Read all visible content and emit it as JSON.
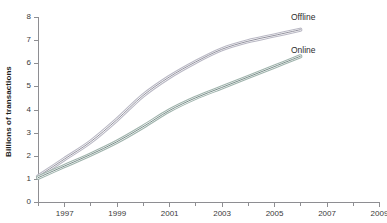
{
  "chart_data": {
    "type": "line",
    "title": "",
    "subtitle": "",
    "xlabel": "",
    "ylabel": "Billions of transactions",
    "xlim": [
      1996,
      2009
    ],
    "ylim": [
      0,
      8
    ],
    "grid": false,
    "legend_position": "right-inline-labels",
    "x_tick_labels": [
      "1997",
      "1999",
      "2001",
      "2003",
      "2005",
      "2007",
      "2009"
    ],
    "x_tick_values": [
      1997,
      1999,
      2001,
      2003,
      2005,
      2007,
      2009
    ],
    "x_minor_tick_values": [
      1996,
      1998,
      2000,
      2002,
      2004,
      2006,
      2008
    ],
    "y_tick_labels": [
      "0",
      "1",
      "2",
      "3",
      "4",
      "5",
      "6",
      "7",
      "8"
    ],
    "y_tick_values": [
      0,
      1,
      2,
      3,
      4,
      5,
      6,
      7,
      8
    ],
    "x": [
      1996,
      1997,
      1998,
      1999,
      2000,
      2001,
      2002,
      2003,
      2004,
      2005,
      2006
    ],
    "series": [
      {
        "name": "Offline",
        "color": "#b9b8c4",
        "core_color": "#7e7d8c",
        "values": [
          1.1,
          1.85,
          2.6,
          3.55,
          4.6,
          5.4,
          6.05,
          6.6,
          6.95,
          7.2,
          7.45
        ]
      },
      {
        "name": "Online",
        "color": "#9fb3ac",
        "core_color": "#5e7772",
        "values": [
          1.05,
          1.55,
          2.05,
          2.6,
          3.25,
          3.95,
          4.5,
          4.95,
          5.4,
          5.85,
          6.3
        ]
      }
    ],
    "annotations": [
      {
        "text": "Offline",
        "anchor_series": "Offline",
        "anchor_x": 2006
      },
      {
        "text": "Online",
        "anchor_series": "Online",
        "anchor_x": 2006
      }
    ]
  },
  "axes": {
    "y_title": "Billions of transactions",
    "axis_color": "#8e8e92",
    "tick_text_color": "#3a3a3a"
  },
  "labels": {
    "offline": "Offline",
    "online": "Online"
  }
}
